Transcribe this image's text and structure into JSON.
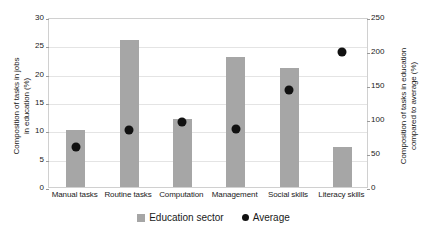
{
  "chart_data": {
    "type": "bar",
    "title": "",
    "xlabel": "",
    "categories": [
      "Manual tasks",
      "Routine tasks",
      "Computation",
      "Management",
      "Social skills",
      "Literacy skills"
    ],
    "series": [
      {
        "name": "Education sector",
        "axis": "left",
        "marker": "bar",
        "color": "#a6a6a6",
        "values": [
          10,
          26,
          12,
          23,
          21,
          7
        ]
      },
      {
        "name": "Average",
        "axis": "right",
        "marker": "dot",
        "color": "#111111",
        "values": [
          65,
          90,
          102,
          92,
          150,
          205
        ]
      }
    ],
    "y_left": {
      "label": "Composition of tasks in jobs\nin education (%)",
      "ticks": [
        0,
        5,
        10,
        15,
        20,
        25,
        30
      ],
      "ylim": [
        0,
        30
      ]
    },
    "y_right": {
      "label": "Composition of tasks in education\ncompared to average (%)",
      "ticks": [
        0,
        50,
        100,
        150,
        200,
        250
      ],
      "ylim": [
        0,
        250
      ]
    },
    "grid": true,
    "legend_position": "bottom",
    "legend": [
      {
        "label": "Education sector",
        "marker": "square",
        "color": "#a6a6a6"
      },
      {
        "label": "Average",
        "marker": "circle",
        "color": "#111111"
      }
    ]
  }
}
